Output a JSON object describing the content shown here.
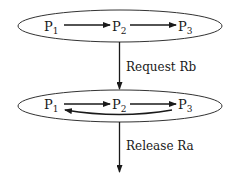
{
  "diagram": {
    "type": "state-transition",
    "states": [
      {
        "id": "state-1",
        "processes": [
          {
            "base": "P",
            "sub": "1"
          },
          {
            "base": "P",
            "sub": "2"
          },
          {
            "base": "P",
            "sub": "3"
          }
        ],
        "edges": [
          "P1 -> P2",
          "P2 -> P3"
        ]
      },
      {
        "id": "state-2",
        "processes": [
          {
            "base": "P",
            "sub": "1"
          },
          {
            "base": "P",
            "sub": "2"
          },
          {
            "base": "P",
            "sub": "3"
          }
        ],
        "edges": [
          "P1 -> P2",
          "P2 -> P3",
          "P3 -> P1"
        ]
      }
    ],
    "transitions": [
      {
        "label": "Request Rb",
        "from": "state-1",
        "to": "state-2"
      },
      {
        "label": "Release Ra",
        "from": "state-2",
        "to": "next"
      }
    ],
    "colors": {
      "stroke": "#1a1a1a",
      "background": "#ffffff"
    }
  }
}
